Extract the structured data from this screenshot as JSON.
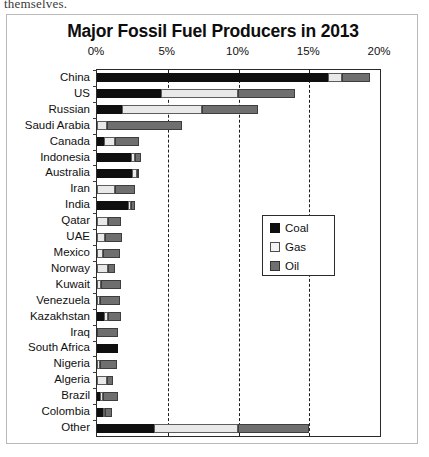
{
  "page": {
    "partial_text_above": "themselves."
  },
  "chart_data": {
    "type": "bar",
    "orientation": "horizontal",
    "stacked": true,
    "title": "Major Fossil Fuel Producers in 2013",
    "xlabel": "",
    "ylabel": "",
    "xlim": [
      0,
      20
    ],
    "tick_labels": [
      "0%",
      "5%",
      "10%",
      "15%",
      "20%"
    ],
    "tick_values": [
      0,
      5,
      10,
      15,
      20
    ],
    "grid": true,
    "legend_position": "center-right",
    "legend": [
      "Coal",
      "Gas",
      "Oil"
    ],
    "colors": {
      "Coal": "#0f0f0f",
      "Gas": "#e9e9e9",
      "Oil": "#6f6f6f"
    },
    "categories": [
      "China",
      "US",
      "Russian",
      "Saudi Arabia",
      "Canada",
      "Indonesia",
      "Australia",
      "Iran",
      "India",
      "Qatar",
      "UAE",
      "Mexico",
      "Norway",
      "Kuwait",
      "Venezuela",
      "Kazakhstan",
      "Iraq",
      "South Africa",
      "Nigeria",
      "Algeria",
      "Brazil",
      "Colombia",
      "Other"
    ],
    "series": [
      {
        "name": "Coal",
        "values": [
          16.3,
          4.5,
          1.8,
          0.0,
          0.5,
          2.4,
          2.5,
          0.0,
          2.2,
          0.0,
          0.0,
          0.0,
          0.0,
          0.0,
          0.0,
          0.5,
          0.0,
          1.5,
          0.0,
          0.0,
          0.2,
          0.4,
          4.0
        ]
      },
      {
        "name": "Gas",
        "values": [
          1.0,
          5.5,
          5.6,
          0.7,
          0.8,
          0.3,
          0.3,
          1.3,
          0.2,
          0.8,
          0.6,
          0.4,
          0.8,
          0.3,
          0.2,
          0.3,
          0.0,
          0.0,
          0.2,
          0.7,
          0.2,
          0.1,
          6.0
        ]
      },
      {
        "name": "Oil",
        "values": [
          2.0,
          4.0,
          4.0,
          5.3,
          1.7,
          0.4,
          0.1,
          1.4,
          0.3,
          0.9,
          1.2,
          1.2,
          0.5,
          1.4,
          1.4,
          0.9,
          1.5,
          0.0,
          1.2,
          0.4,
          1.1,
          0.5,
          5.0
        ]
      }
    ]
  }
}
